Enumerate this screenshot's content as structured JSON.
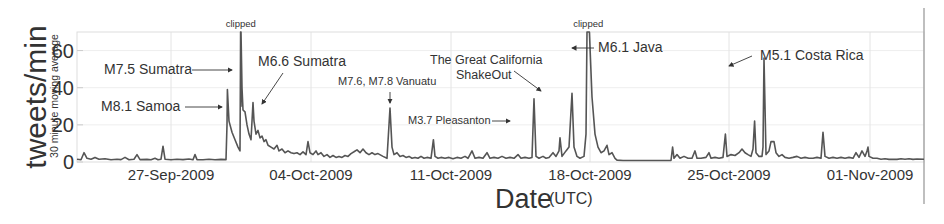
{
  "chart_data": {
    "type": "line",
    "title": "",
    "xlabel": "Date",
    "xlabel_suffix": "(UTC)",
    "ylabel": "tweets/min",
    "ylabel_sub": "30 minute moving average",
    "ylim": [
      0,
      70
    ],
    "xlim_days_from_22_Sep_2009": [
      0,
      42.35
    ],
    "grid": true,
    "legend": null,
    "y_ticks": [
      0,
      20,
      40,
      60
    ],
    "x_ticks": [
      {
        "label": "27-Sep-2009",
        "day": 4.7
      },
      {
        "label": "04-Oct-2009",
        "day": 11.7
      },
      {
        "label": "11-Oct-2009",
        "day": 18.7
      },
      {
        "label": "18-Oct-2009",
        "day": 25.65
      },
      {
        "label": "25-Oct-2009",
        "day": 32.6
      },
      {
        "label": "01-Nov-2009",
        "day": 39.65
      }
    ],
    "series": [
      {
        "name": "tweets/min (30 minute moving average)",
        "color": "#555555",
        "points": [
          [
            0,
            1.5
          ],
          [
            0.2,
            1.2
          ],
          [
            0.35,
            5
          ],
          [
            0.5,
            2
          ],
          [
            0.7,
            1.5
          ],
          [
            0.9,
            2.5
          ],
          [
            1.1,
            1.5
          ],
          [
            1.4,
            1.8
          ],
          [
            1.7,
            1.2
          ],
          [
            2.0,
            1.5
          ],
          [
            2.2,
            1.3
          ],
          [
            2.4,
            2.5
          ],
          [
            2.6,
            1.2
          ],
          [
            2.85,
            1.5
          ],
          [
            3.0,
            4
          ],
          [
            3.15,
            1.3
          ],
          [
            3.5,
            1.4
          ],
          [
            3.7,
            1.2
          ],
          [
            3.9,
            2
          ],
          [
            4.05,
            1.2
          ],
          [
            4.2,
            1.5
          ],
          [
            4.3,
            8.5
          ],
          [
            4.4,
            1.5
          ],
          [
            4.7,
            1.2
          ],
          [
            5.0,
            1.5
          ],
          [
            5.3,
            1.3
          ],
          [
            5.6,
            1.6
          ],
          [
            5.8,
            1.2
          ],
          [
            5.9,
            4
          ],
          [
            6.0,
            1.3
          ],
          [
            6.3,
            1.2
          ],
          [
            6.6,
            1.5
          ],
          [
            6.9,
            1.2
          ],
          [
            7.2,
            1.4
          ],
          [
            7.45,
            1.3
          ],
          [
            7.5,
            20
          ],
          [
            7.52,
            39
          ],
          [
            7.6,
            22
          ],
          [
            7.75,
            16
          ],
          [
            7.9,
            12
          ],
          [
            8.05,
            8
          ],
          [
            8.15,
            6
          ],
          [
            8.2,
            30
          ],
          [
            8.17,
            45
          ],
          [
            8.18,
            72
          ],
          [
            8.2,
            72
          ],
          [
            8.25,
            40
          ],
          [
            8.3,
            28
          ],
          [
            8.4,
            27
          ],
          [
            8.5,
            20
          ],
          [
            8.6,
            15
          ],
          [
            8.7,
            12
          ],
          [
            8.8,
            32
          ],
          [
            8.85,
            22
          ],
          [
            8.95,
            15
          ],
          [
            9.05,
            17
          ],
          [
            9.15,
            13
          ],
          [
            9.25,
            14
          ],
          [
            9.35,
            11
          ],
          [
            9.45,
            12
          ],
          [
            9.55,
            9
          ],
          [
            9.7,
            8
          ],
          [
            9.85,
            7
          ],
          [
            10.0,
            9
          ],
          [
            10.1,
            6
          ],
          [
            10.25,
            7
          ],
          [
            10.4,
            5
          ],
          [
            10.55,
            6
          ],
          [
            10.7,
            5
          ],
          [
            10.85,
            4.5
          ],
          [
            11.0,
            5
          ],
          [
            11.15,
            4
          ],
          [
            11.3,
            5.5
          ],
          [
            11.45,
            4
          ],
          [
            11.55,
            11
          ],
          [
            11.65,
            5
          ],
          [
            11.8,
            4
          ],
          [
            11.95,
            6
          ],
          [
            12.05,
            4
          ],
          [
            12.2,
            5
          ],
          [
            12.35,
            3
          ],
          [
            12.5,
            4
          ],
          [
            12.65,
            2.5
          ],
          [
            12.8,
            3.5
          ],
          [
            12.95,
            2.5
          ],
          [
            13.1,
            3
          ],
          [
            13.25,
            2.5
          ],
          [
            13.4,
            3.5
          ],
          [
            13.55,
            3
          ],
          [
            13.7,
            4.5
          ],
          [
            13.85,
            5.5
          ],
          [
            14.0,
            6.5
          ],
          [
            14.15,
            5
          ],
          [
            14.3,
            7
          ],
          [
            14.45,
            5
          ],
          [
            14.6,
            4
          ],
          [
            14.75,
            5
          ],
          [
            14.9,
            4
          ],
          [
            15.05,
            4.5
          ],
          [
            15.3,
            3
          ],
          [
            15.5,
            2
          ],
          [
            15.65,
            29
          ],
          [
            15.75,
            8
          ],
          [
            15.85,
            4
          ],
          [
            16.0,
            5
          ],
          [
            16.15,
            3
          ],
          [
            16.3,
            3.5
          ],
          [
            16.45,
            2.5
          ],
          [
            16.6,
            3
          ],
          [
            16.75,
            2
          ],
          [
            16.9,
            2.5
          ],
          [
            17.05,
            2
          ],
          [
            17.2,
            3
          ],
          [
            17.35,
            2
          ],
          [
            17.5,
            2.5
          ],
          [
            17.7,
            2
          ],
          [
            17.82,
            12
          ],
          [
            17.9,
            3
          ],
          [
            18.05,
            2
          ],
          [
            18.2,
            2.5
          ],
          [
            18.4,
            2
          ],
          [
            18.6,
            2.5
          ],
          [
            18.8,
            1.8
          ],
          [
            19.0,
            2.5
          ],
          [
            19.2,
            2
          ],
          [
            19.4,
            3
          ],
          [
            19.55,
            2
          ],
          [
            19.75,
            6
          ],
          [
            19.9,
            2
          ],
          [
            20.1,
            2.5
          ],
          [
            20.3,
            2
          ],
          [
            20.5,
            5
          ],
          [
            20.65,
            2
          ],
          [
            20.85,
            2.5
          ],
          [
            21.05,
            2
          ],
          [
            21.25,
            3
          ],
          [
            21.45,
            2
          ],
          [
            21.65,
            2.5
          ],
          [
            21.85,
            2
          ],
          [
            22.05,
            4
          ],
          [
            22.2,
            2
          ],
          [
            22.4,
            2.5
          ],
          [
            22.6,
            2
          ],
          [
            22.75,
            2.5
          ],
          [
            22.85,
            34
          ],
          [
            22.95,
            3
          ],
          [
            23.1,
            2
          ],
          [
            23.3,
            3
          ],
          [
            23.45,
            2
          ],
          [
            23.6,
            2.5
          ],
          [
            23.8,
            5
          ],
          [
            23.95,
            3
          ],
          [
            24.1,
            6
          ],
          [
            24.15,
            13
          ],
          [
            24.25,
            3
          ],
          [
            24.45,
            6
          ],
          [
            24.6,
            8
          ],
          [
            24.75,
            37
          ],
          [
            24.85,
            8
          ],
          [
            25.0,
            3
          ],
          [
            25.15,
            2
          ],
          [
            25.35,
            3
          ],
          [
            25.45,
            15
          ],
          [
            25.5,
            72
          ],
          [
            25.62,
            72
          ],
          [
            25.75,
            35
          ],
          [
            25.9,
            15
          ],
          [
            26.05,
            8
          ],
          [
            26.2,
            5
          ],
          [
            26.35,
            6
          ],
          [
            26.5,
            9
          ],
          [
            26.6,
            4
          ],
          [
            26.75,
            5
          ],
          [
            26.9,
            2
          ],
          [
            27.0,
            1
          ],
          [
            27.3,
            0.8
          ],
          [
            28.0,
            0.8
          ],
          [
            29.0,
            0.8
          ],
          [
            29.7,
            0.8
          ],
          [
            29.78,
            8
          ],
          [
            29.85,
            2
          ],
          [
            30.0,
            4
          ],
          [
            30.15,
            2
          ],
          [
            30.35,
            3
          ],
          [
            30.55,
            2
          ],
          [
            30.75,
            2
          ],
          [
            30.9,
            6
          ],
          [
            31.0,
            2
          ],
          [
            31.2,
            2
          ],
          [
            31.45,
            2.5
          ],
          [
            31.6,
            5
          ],
          [
            31.7,
            2
          ],
          [
            31.9,
            2.5
          ],
          [
            32.1,
            2
          ],
          [
            32.3,
            2.5
          ],
          [
            32.42,
            15
          ],
          [
            32.5,
            3
          ],
          [
            32.7,
            4
          ],
          [
            32.9,
            3.5
          ],
          [
            33.1,
            5
          ],
          [
            33.25,
            7
          ],
          [
            33.4,
            5
          ],
          [
            33.55,
            4
          ],
          [
            33.7,
            3
          ],
          [
            33.8,
            7
          ],
          [
            33.88,
            22
          ],
          [
            33.95,
            5
          ],
          [
            34.1,
            3
          ],
          [
            34.25,
            3
          ],
          [
            34.3,
            8
          ],
          [
            34.35,
            56
          ],
          [
            34.45,
            4
          ],
          [
            34.6,
            6
          ],
          [
            34.7,
            11
          ],
          [
            34.85,
            11
          ],
          [
            34.95,
            5
          ],
          [
            35.1,
            3
          ],
          [
            35.25,
            4
          ],
          [
            35.4,
            2.5
          ],
          [
            35.6,
            2
          ],
          [
            35.8,
            2.5
          ],
          [
            36.0,
            3
          ],
          [
            36.2,
            2
          ],
          [
            36.4,
            2.5
          ],
          [
            36.6,
            2
          ],
          [
            36.8,
            2
          ],
          [
            37.0,
            2.5
          ],
          [
            37.2,
            2
          ],
          [
            37.3,
            16
          ],
          [
            37.4,
            3
          ],
          [
            37.6,
            2
          ],
          [
            37.8,
            2.5
          ],
          [
            38.0,
            2
          ],
          [
            38.2,
            2.5
          ],
          [
            38.4,
            2
          ],
          [
            38.6,
            2.5
          ],
          [
            38.8,
            2
          ],
          [
            38.95,
            5
          ],
          [
            39.1,
            2.5
          ],
          [
            39.25,
            6
          ],
          [
            39.4,
            3
          ],
          [
            39.5,
            6
          ],
          [
            39.55,
            8
          ],
          [
            39.6,
            3
          ],
          [
            39.8,
            2
          ],
          [
            40.0,
            2
          ],
          [
            40.2,
            1.5
          ],
          [
            40.4,
            1.8
          ],
          [
            40.6,
            1.4
          ],
          [
            40.8,
            1.5
          ],
          [
            41.0,
            1.4
          ],
          [
            41.2,
            1.7
          ],
          [
            41.4,
            1.5
          ],
          [
            41.6,
            1.8
          ],
          [
            41.8,
            1.4
          ],
          [
            42.0,
            1.6
          ],
          [
            42.35,
            1.5
          ]
        ]
      }
    ],
    "annotations": [
      {
        "text": "clipped",
        "day": 8.19,
        "y_px": 24,
        "size": "small"
      },
      {
        "text": "clipped",
        "day": 25.56,
        "y_px": 24,
        "size": "small"
      },
      {
        "text": "M7.5 Sumatra",
        "x_px": 104,
        "y_px": 74,
        "arrow": [
          [
            192,
            70
          ],
          [
            232,
            70
          ]
        ]
      },
      {
        "text": "M8.1 Samoa",
        "x_px": 101,
        "y_px": 111,
        "arrow": [
          [
            185,
            107
          ],
          [
            222,
            107
          ]
        ]
      },
      {
        "text": "M6.6 Sumatra",
        "x_px": 258,
        "y_px": 66,
        "arrow": [
          [
            283,
            73
          ],
          [
            262,
            104
          ]
        ]
      },
      {
        "text": "M7.6, M7.8 Vanuatu",
        "x_px": 338,
        "y_px": 85,
        "size": "small",
        "arrow": [
          [
            390,
            92
          ],
          [
            390,
            103
          ]
        ]
      },
      {
        "text": "M3.7 Pleasanton",
        "x_px": 408,
        "y_px": 124,
        "size": "small",
        "arrow": [
          [
            492,
            121
          ],
          [
            510,
            121
          ]
        ]
      },
      {
        "text": "The Great California",
        "x_px": 430,
        "y_px": 64,
        "size": "medium"
      },
      {
        "text": "ShakeOut",
        "x_px": 456,
        "y_px": 79,
        "size": "medium",
        "arrow": [
          [
            514,
            71
          ],
          [
            541,
            91
          ]
        ]
      },
      {
        "text": "M6.1 Java",
        "x_px": 598,
        "y_px": 52,
        "arrow": [
          [
            594,
            48
          ],
          [
            572,
            48
          ]
        ]
      },
      {
        "text": "M5.1 Costa Rica",
        "x_px": 760,
        "y_px": 60,
        "arrow": [
          [
            752,
            56
          ],
          [
            729,
            66
          ]
        ]
      }
    ]
  },
  "axes": {
    "ylabel": "tweets/min",
    "ylabel_sub": "30 minute moving average",
    "xlabel": "Date",
    "xlabel_suffix": "(UTC)",
    "clipped_label": "clipped"
  }
}
